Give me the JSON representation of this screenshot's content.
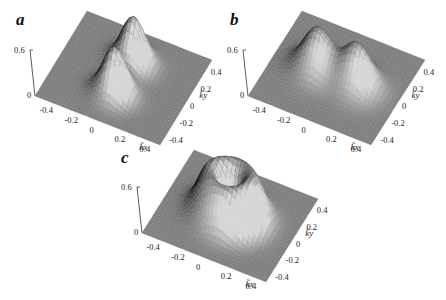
{
  "chart_data": [
    {
      "type": "surface",
      "panel": "a",
      "title": "",
      "xlabel": "k̃x",
      "ylabel": "k̃y",
      "zlabel": "",
      "x_ticks": [
        "-0.4",
        "-0.2",
        "0",
        "0.2",
        "0.4"
      ],
      "y_ticks": [
        "-0.4",
        "-0.2",
        "0",
        "0.2",
        "0.4"
      ],
      "z_ticks": [
        "0",
        "0.6"
      ],
      "xlim": [
        -0.5,
        0.5
      ],
      "ylim": [
        -0.5,
        0.5
      ],
      "zlim": [
        0,
        0.6
      ],
      "description": "Two separated Gaussian peaks along ky axis",
      "peaks": [
        {
          "kx": 0.0,
          "ky": -0.18,
          "height": 0.6,
          "width": 0.09
        },
        {
          "kx": 0.0,
          "ky": 0.18,
          "height": 0.6,
          "width": 0.09
        }
      ]
    },
    {
      "type": "surface",
      "panel": "b",
      "title": "",
      "xlabel": "k̃x",
      "ylabel": "k̃y",
      "x_ticks": [
        "-0.4",
        "-0.2",
        "0",
        "0.2",
        "0.4"
      ],
      "y_ticks": [
        "-0.4",
        "-0.2",
        "0",
        "0.2",
        "0.4"
      ],
      "z_ticks": [
        "0",
        "0.6"
      ],
      "xlim": [
        -0.5,
        0.5
      ],
      "ylim": [
        -0.5,
        0.5
      ],
      "zlim": [
        0,
        0.6
      ],
      "description": "Two broader peaks separated along kx axis",
      "peaks": [
        {
          "kx": -0.16,
          "ky": 0.0,
          "height": 0.55,
          "width": 0.11
        },
        {
          "kx": 0.16,
          "ky": 0.0,
          "height": 0.55,
          "width": 0.11
        }
      ]
    },
    {
      "type": "surface",
      "panel": "c",
      "title": "",
      "xlabel": "k̃x",
      "ylabel": "k̃y",
      "x_ticks": [
        "-0.4",
        "-0.2",
        "0",
        "0.2",
        "0.4"
      ],
      "y_ticks": [
        "-0.4",
        "-0.2",
        "0",
        "0.2",
        "0.4"
      ],
      "z_ticks": [
        "0",
        "0.6"
      ],
      "xlim": [
        -0.5,
        0.5
      ],
      "ylim": [
        -0.5,
        0.5
      ],
      "zlim": [
        0,
        0.6
      ],
      "description": "Ring (crater) shaped distribution centered at origin",
      "ring": {
        "radius": 0.16,
        "height": 0.6,
        "width": 0.09
      }
    }
  ],
  "panels": [
    {
      "label": "a",
      "xlabel": "k̃x",
      "ylabel": "k̃y",
      "z_top": "0.6",
      "z_bottom": "0"
    },
    {
      "label": "b",
      "xlabel": "k̃x",
      "ylabel": "k̃y",
      "z_top": "0.6",
      "z_bottom": "0"
    },
    {
      "label": "c",
      "xlabel": "k̃x",
      "ylabel": "k̃y",
      "z_top": "0.6",
      "z_bottom": "0"
    }
  ]
}
